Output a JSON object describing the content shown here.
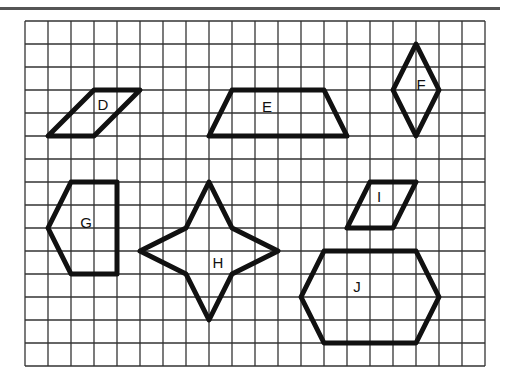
{
  "grid": {
    "origin_x": 25,
    "origin_y": 21,
    "cell": 23,
    "cols": 20,
    "rows": 15,
    "line_color": "#333333"
  },
  "shapes": [
    {
      "label": "D",
      "points": [
        [
          1,
          5
        ],
        [
          3,
          5
        ],
        [
          5,
          3
        ],
        [
          3,
          3
        ]
      ],
      "label_pos": [
        103,
        104
      ]
    },
    {
      "label": "E",
      "points": [
        [
          8,
          5
        ],
        [
          14,
          5
        ],
        [
          13,
          3
        ],
        [
          9,
          3
        ]
      ],
      "label_pos": [
        267,
        106
      ]
    },
    {
      "label": "F",
      "points": [
        [
          17,
          1
        ],
        [
          18,
          3
        ],
        [
          17,
          5
        ],
        [
          16,
          3
        ]
      ],
      "label_pos": [
        421,
        84
      ]
    },
    {
      "label": "G",
      "points": [
        [
          2,
          7
        ],
        [
          4,
          7
        ],
        [
          4,
          11
        ],
        [
          2,
          11
        ],
        [
          1,
          9
        ]
      ],
      "label_pos": [
        86,
        222
      ]
    },
    {
      "label": "H",
      "points": [
        [
          8,
          7
        ],
        [
          9,
          9
        ],
        [
          11,
          10
        ],
        [
          9,
          11
        ],
        [
          8,
          13
        ],
        [
          7,
          11
        ],
        [
          5,
          10
        ],
        [
          7,
          9
        ]
      ],
      "label_pos": [
        218,
        262
      ]
    },
    {
      "label": "I",
      "points": [
        [
          14,
          9
        ],
        [
          16,
          9
        ],
        [
          17,
          7
        ],
        [
          15,
          7
        ]
      ],
      "label_pos": [
        379,
        196
      ]
    },
    {
      "label": "J",
      "points": [
        [
          13,
          10
        ],
        [
          17,
          10
        ],
        [
          18,
          12
        ],
        [
          17,
          14
        ],
        [
          13,
          14
        ],
        [
          12,
          12
        ]
      ],
      "label_pos": [
        357,
        286
      ]
    }
  ],
  "colors": {
    "shape_stroke": "#111111",
    "top_rule": "#555555"
  }
}
